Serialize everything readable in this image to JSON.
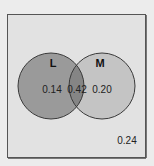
{
  "diagram": {
    "type": "venn",
    "sets": [
      {
        "name": "L",
        "only_value": "0.14",
        "fill": "#9a9a9a"
      },
      {
        "name": "M",
        "only_value": "0.20",
        "fill": "#c4c4c4"
      }
    ],
    "intersection_value": "0.42",
    "intersection_fill": "#858585",
    "outside_value": "0.24",
    "universe_fill": "#e2e2e2",
    "background": "#ececec",
    "stroke": "#3a3a3a"
  }
}
